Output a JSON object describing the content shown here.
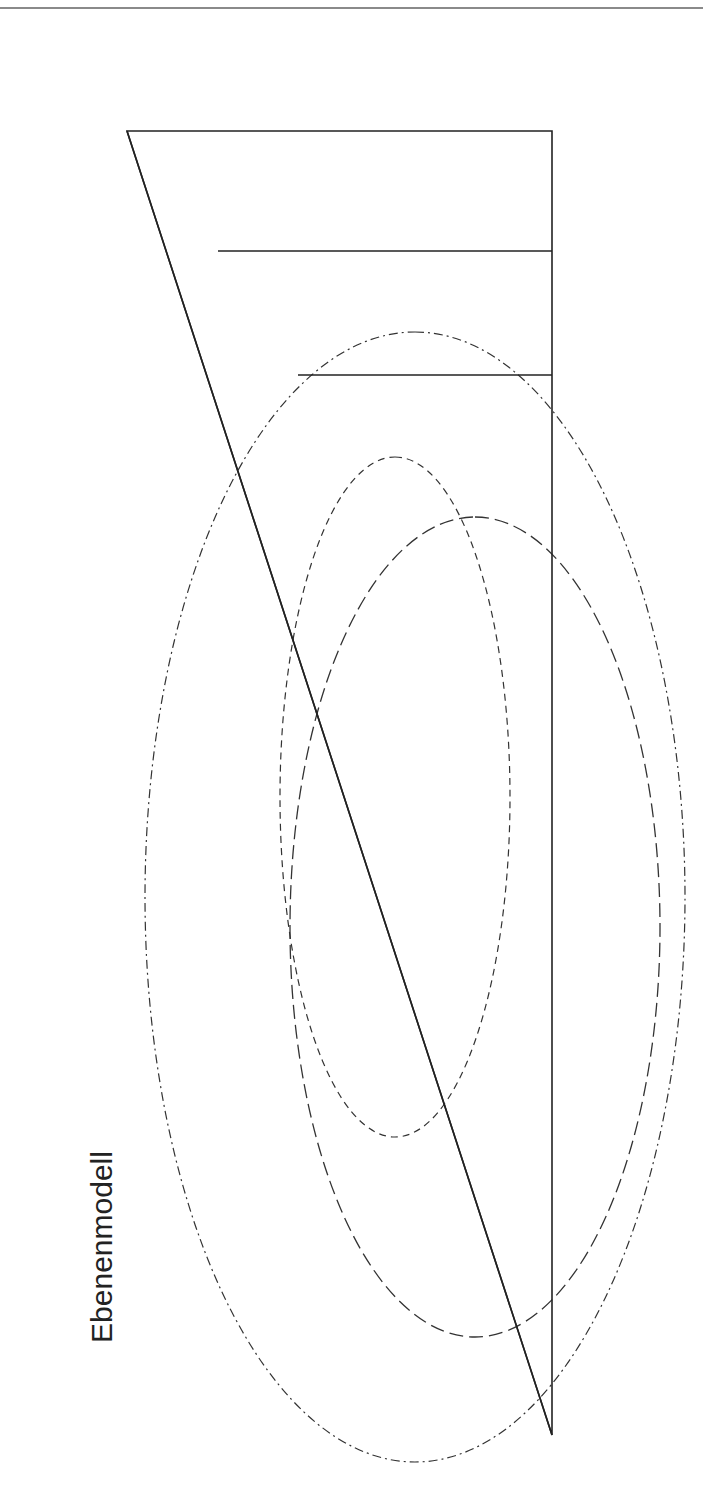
{
  "diagram": {
    "title": "Ebenenmodell",
    "pyramid_levels": [
      {
        "name": "ule",
        "lines": [
          "ULE",
          "(ERP)"
        ]
      },
      {
        "name": "betriebsleitebene",
        "lines": [
          "Betriebsleitebene",
          "(MES)"
        ]
      },
      {
        "name": "prozessfuehrungsebene",
        "lines": [
          "Prozessführungsebene",
          "(Prozessdatenverarbeitung,",
          "Bedien- & Beobachtungsebene)"
        ]
      },
      {
        "name": "steuerungsebene",
        "lines": [
          "Steuerungs- und Regelungsebene",
          "(Prozessdatenaufbereitung, SPS-Technik)"
        ]
      },
      {
        "name": "feldebene",
        "lines": [
          "Feldebene",
          "(Sensorik, Aktorik)"
        ]
      }
    ],
    "side_labels": {
      "produktionsleittechnik": [
        "Produktions",
        "leittechnik"
      ],
      "pls": "PLS",
      "plt": "PLT",
      "prozessleitebene": [
        "Prozess-",
        "leitebene"
      ]
    },
    "legend_left": [
      {
        "abbr": "ULE:",
        "text": "Unternehmensleitebene"
      },
      {
        "abbr": "ERP:",
        "text": "Enterprise Resource Planning"
      },
      {
        "abbr": "MES:",
        "text": "Manufacturing Execution System"
      }
    ],
    "legend_right": [
      {
        "abbr": "PLS:",
        "text": "Prozessleitsystem"
      },
      {
        "abbr": "PLT:",
        "text": "Prozessleittechnik"
      }
    ]
  },
  "table": {
    "heading": "Betrachtung des Ebenenmodells aus",
    "columns": [
      "funktioneller Sicht",
      "örtlicher Sicht",
      "Büro-/Anlagensicht"
    ],
    "functional": [
      "Informationsverarbeitung",
      "Informationser-",
      "fassung/-ausgabe"
    ],
    "local": [
      "Unternehmensleitung",
      "Betriebsleitung",
      "Prozessleitwarte",
      "Schaltraum",
      "Feld"
    ],
    "office": [
      "„Bürowelt“",
      "„Anlagenwelt“"
    ]
  }
}
